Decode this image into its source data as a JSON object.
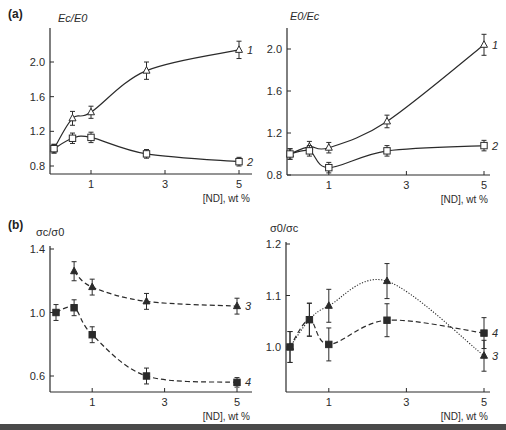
{
  "figure": {
    "panel_labels": [
      "(a)",
      "(b)"
    ]
  },
  "chart_data": [
    {
      "id": "a-left",
      "type": "line",
      "panel": "(a)",
      "ylabel": "Ec/E0",
      "xlabel": "[ND], wt %",
      "xticks": [
        1,
        3,
        5
      ],
      "yticks": [
        0.8,
        1.2,
        1.6,
        2.0
      ],
      "xlim": [
        0,
        5.2
      ],
      "ylim": [
        0.75,
        2.25
      ],
      "grid": false,
      "series": [
        {
          "name": "1",
          "marker": "open-triangle",
          "line": "solid",
          "x": [
            0,
            0.5,
            1,
            2.5,
            5
          ],
          "y": [
            1.0,
            1.35,
            1.42,
            1.9,
            2.14
          ],
          "err": [
            0.05,
            0.08,
            0.07,
            0.1,
            0.1
          ]
        },
        {
          "name": "2",
          "marker": "open-square",
          "line": "solid",
          "x": [
            0,
            0.5,
            1,
            2.5,
            5
          ],
          "y": [
            1.0,
            1.12,
            1.13,
            0.94,
            0.85
          ],
          "err": [
            0.05,
            0.06,
            0.06,
            0.05,
            0.05
          ]
        }
      ]
    },
    {
      "id": "a-right",
      "type": "line",
      "panel": "(a)",
      "ylabel": "E0/Ec",
      "xlabel": "[ND], wt %",
      "xticks": [
        1,
        3,
        5
      ],
      "yticks": [
        0.8,
        1.2,
        1.6,
        2.0
      ],
      "xlim": [
        0,
        5.2
      ],
      "ylim": [
        0.8,
        2.2
      ],
      "grid": false,
      "series": [
        {
          "name": "1",
          "marker": "open-triangle",
          "line": "solid",
          "x": [
            0,
            0.5,
            1,
            2.5,
            5
          ],
          "y": [
            1.0,
            1.07,
            1.06,
            1.31,
            2.04
          ],
          "err": [
            0.05,
            0.05,
            0.05,
            0.06,
            0.1
          ]
        },
        {
          "name": "2",
          "marker": "open-square",
          "line": "solid",
          "x": [
            0,
            0.5,
            1,
            2.5,
            5
          ],
          "y": [
            1.0,
            1.03,
            0.87,
            1.03,
            1.08
          ],
          "err": [
            0.05,
            0.05,
            0.05,
            0.05,
            0.05
          ]
        }
      ]
    },
    {
      "id": "b-left",
      "type": "line",
      "panel": "(b)",
      "ylabel": "σc/σ0",
      "xlabel": "[ND], wt %",
      "xticks": [
        1,
        3,
        5
      ],
      "yticks": [
        0.6,
        1.0,
        1.4
      ],
      "xlim": [
        0,
        5.2
      ],
      "ylim": [
        0.5,
        1.4
      ],
      "grid": false,
      "series": [
        {
          "name": "3",
          "marker": "filled-triangle",
          "line": "dashed",
          "x": [
            0.5,
            1,
            2.5,
            5
          ],
          "y": [
            1.26,
            1.16,
            1.07,
            1.04
          ],
          "err": [
            0.06,
            0.05,
            0.05,
            0.05
          ]
        },
        {
          "name": "4",
          "marker": "filled-square",
          "line": "dashed",
          "x": [
            0,
            0.5,
            1,
            2.5,
            5
          ],
          "y": [
            1.0,
            1.03,
            0.86,
            0.6,
            0.56
          ],
          "err": [
            0.05,
            0.05,
            0.05,
            0.05,
            0.03
          ]
        }
      ]
    },
    {
      "id": "b-right",
      "type": "line",
      "panel": "(b)",
      "ylabel": "σ0/σc",
      "xlabel": "[ND], wt %",
      "xticks": [
        1,
        3,
        5
      ],
      "yticks": [
        1.0,
        1.1,
        1.2
      ],
      "xlim": [
        0,
        5.2
      ],
      "ylim": [
        0.912,
        1.2
      ],
      "grid": false,
      "series": [
        {
          "name": "3",
          "marker": "filled-triangle",
          "line": "dotted",
          "x": [
            0,
            0.5,
            1,
            2.5,
            5
          ],
          "y": [
            1.0,
            1.053,
            1.08,
            1.128,
            0.983
          ],
          "err": [
            0.03,
            0.032,
            0.032,
            0.034,
            0.03
          ]
        },
        {
          "name": "4",
          "marker": "filled-square",
          "line": "dashed",
          "x": [
            0,
            0.5,
            1,
            2.5,
            5
          ],
          "y": [
            1.0,
            1.053,
            1.005,
            1.052,
            1.027
          ],
          "err": [
            0.03,
            0.032,
            0.032,
            0.032,
            0.03
          ]
        }
      ]
    }
  ]
}
